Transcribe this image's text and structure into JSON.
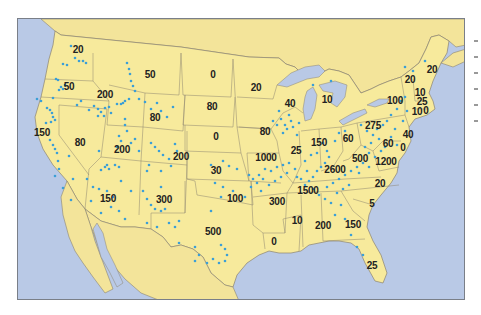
{
  "map": {
    "title": "",
    "colors": {
      "ocean": "#b9c9e6",
      "land": "#f7ea9c",
      "land_foreign": "#f3e49a",
      "border": "#8c8470",
      "dot": "#3c9fd6",
      "label": "#222222"
    },
    "frame": {
      "x": 17,
      "y": 18,
      "width": 448,
      "height": 282
    },
    "region_labels": [
      {
        "id": "washington",
        "value": "20",
        "x": 78,
        "y": 50
      },
      {
        "id": "oregon",
        "value": "50",
        "x": 69,
        "y": 87
      },
      {
        "id": "california",
        "value": "150",
        "x": 42,
        "y": 133
      },
      {
        "id": "nevada",
        "value": "80",
        "x": 80,
        "y": 143
      },
      {
        "id": "idaho",
        "value": "200",
        "x": 105,
        "y": 95
      },
      {
        "id": "montana",
        "value": "50",
        "x": 150,
        "y": 75
      },
      {
        "id": "wyoming",
        "value": "80",
        "x": 155,
        "y": 118
      },
      {
        "id": "utah",
        "value": "200",
        "x": 122,
        "y": 150
      },
      {
        "id": "colorado",
        "value": "200",
        "x": 181,
        "y": 157
      },
      {
        "id": "arizona",
        "value": "150",
        "x": 108,
        "y": 199
      },
      {
        "id": "new-mexico",
        "value": "300",
        "x": 164,
        "y": 200
      },
      {
        "id": "north-dakota",
        "value": "0",
        "x": 213,
        "y": 75
      },
      {
        "id": "south-dakota",
        "value": "80",
        "x": 212,
        "y": 107
      },
      {
        "id": "nebraska",
        "value": "0",
        "x": 216,
        "y": 137
      },
      {
        "id": "kansas",
        "value": "30",
        "x": 216,
        "y": 171
      },
      {
        "id": "oklahoma",
        "value": "100",
        "x": 235,
        "y": 199
      },
      {
        "id": "texas",
        "value": "500",
        "x": 213,
        "y": 232
      },
      {
        "id": "minnesota",
        "value": "20",
        "x": 256,
        "y": 88
      },
      {
        "id": "iowa",
        "value": "80",
        "x": 265,
        "y": 132
      },
      {
        "id": "missouri",
        "value": "1000",
        "x": 266,
        "y": 158
      },
      {
        "id": "arkansas",
        "value": "300",
        "x": 277,
        "y": 202
      },
      {
        "id": "louisiana",
        "value": "0",
        "x": 274,
        "y": 242
      },
      {
        "id": "wisconsin",
        "value": "40",
        "x": 290,
        "y": 104
      },
      {
        "id": "illinois",
        "value": "25",
        "x": 296,
        "y": 151
      },
      {
        "id": "michigan",
        "value": "10",
        "x": 327,
        "y": 100
      },
      {
        "id": "indiana",
        "value": "150",
        "x": 319,
        "y": 143
      },
      {
        "id": "ohio",
        "value": "60",
        "x": 348,
        "y": 139
      },
      {
        "id": "kentucky",
        "value": "2600",
        "x": 335,
        "y": 170
      },
      {
        "id": "tennessee",
        "value": "1500",
        "x": 308,
        "y": 191
      },
      {
        "id": "mississippi",
        "value": "10",
        "x": 297,
        "y": 221
      },
      {
        "id": "alabama",
        "value": "200",
        "x": 323,
        "y": 226
      },
      {
        "id": "georgia",
        "value": "150",
        "x": 353,
        "y": 225
      },
      {
        "id": "florida",
        "value": "25",
        "x": 372,
        "y": 266
      },
      {
        "id": "south-carolina",
        "value": "5",
        "x": 372,
        "y": 204
      },
      {
        "id": "north-carolina",
        "value": "20",
        "x": 380,
        "y": 184
      },
      {
        "id": "virginia",
        "value": "1200",
        "x": 386,
        "y": 162
      },
      {
        "id": "west-virginia",
        "value": "500",
        "x": 360,
        "y": 159
      },
      {
        "id": "pennsylvania",
        "value": "275",
        "x": 373,
        "y": 126
      },
      {
        "id": "maryland",
        "value": "60",
        "x": 388,
        "y": 144
      },
      {
        "id": "delaware",
        "value": "0",
        "x": 403,
        "y": 148
      },
      {
        "id": "new-jersey",
        "value": "40",
        "x": 408,
        "y": 135
      },
      {
        "id": "new-york",
        "value": "100",
        "x": 395,
        "y": 101
      },
      {
        "id": "vermont",
        "value": "20",
        "x": 410,
        "y": 80
      },
      {
        "id": "new-hampshire",
        "value": "10",
        "x": 420,
        "y": 93
      },
      {
        "id": "massachusetts",
        "value": "25",
        "x": 422,
        "y": 102
      },
      {
        "id": "connecticut",
        "value": "10",
        "x": 417,
        "y": 112
      },
      {
        "id": "rhode-island",
        "value": "0",
        "x": 426,
        "y": 111
      },
      {
        "id": "maine",
        "value": "20",
        "x": 432,
        "y": 70
      }
    ],
    "legend_stub_marks": 6
  }
}
